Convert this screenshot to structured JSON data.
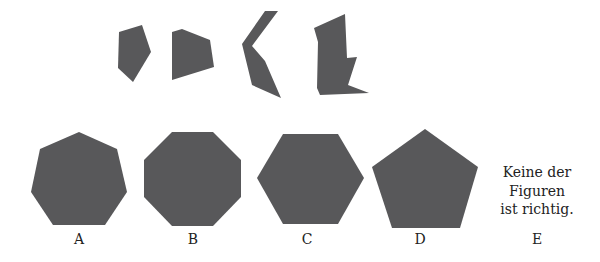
{
  "puzzle": {
    "fill_color": "#58585a",
    "pieces": [
      {
        "name": "piece-1",
        "points": "119,32 142,25 151,52 133,82 118,68"
      },
      {
        "name": "piece-2",
        "points": "172,32 182,29 210,40 214,67 172,80"
      },
      {
        "name": "piece-3",
        "points": "265,11 278,11 252,46 265,61 281,98 252,85 242,44"
      },
      {
        "name": "piece-4",
        "points": "314,28 345,14 347,58 357,57 348,85 369,93 320,95 317,88 318,42"
      }
    ],
    "options": [
      {
        "label": "A",
        "shape": "heptagon",
        "points": "79,132 117,149 127,192 105,225 53,225 31,192 40,149",
        "label_x": 79
      },
      {
        "label": "B",
        "shape": "octagon",
        "points": "172,132 213,132 241,160 241,197 213,226 172,226 144,197 144,160",
        "label_x": 193
      },
      {
        "label": "C",
        "shape": "hexagon",
        "points": "283,134 338,134 364,178 338,224 283,224 257,178",
        "label_x": 307
      },
      {
        "label": "D",
        "shape": "pentagon",
        "points": "425,129 478,167 460,228 392,228 372,167",
        "label_x": 420
      }
    ],
    "option_e": {
      "label": "E",
      "lines": [
        "Keine der",
        "Figuren",
        "ist richtig."
      ]
    }
  }
}
